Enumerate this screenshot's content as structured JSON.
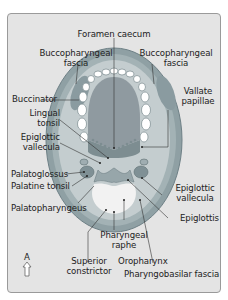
{
  "diagram": {
    "colors": {
      "background": "#e4e4e4",
      "frame_border": "#9a9a9a",
      "tongue": "#8f9aa0",
      "tongue_base": "#7a8c90",
      "mucosa": "#a9b5b8",
      "muscle": "#8a9ba0",
      "teeth": "#ffffff",
      "oropharynx_lumen": "#f2f2f2",
      "label_text": "#222222",
      "leader_line": "#333333"
    },
    "labels": {
      "foramen_caecum": "Foramen caecum",
      "buccopharyngeal_fascia_left": "Buccopharyngeal\nfascia",
      "buccopharyngeal_fascia_left_l1": "Buccopharyngeal",
      "buccopharyngeal_fascia_left_l2": "fascia",
      "buccopharyngeal_fascia_right_l1": "Buccopharyngeal",
      "buccopharyngeal_fascia_right_l2": "fascia",
      "buccinator": "Buccinator",
      "vallate_papillae_l1": "Vallate",
      "vallate_papillae_l2": "papillae",
      "lingual_tonsil_l1": "Lingual",
      "lingual_tonsil_l2": "tonsil",
      "epiglottic_vallecula_left_l1": "Epiglottic",
      "epiglottic_vallecula_left_l2": "vallecula",
      "palatoglossus": "Palatoglossus",
      "palatine_tonsil": "Palatine tonsil",
      "epiglottic_vallecula_right_l1": "Epiglottic",
      "epiglottic_vallecula_right_l2": "vallecula",
      "palatopharyngeus": "Palatopharyngeus",
      "epiglottis": "Epiglottis",
      "pharyngeal_raphe_l1": "Pharyngeal",
      "pharyngeal_raphe_l2": "raphe",
      "superior_constrictor_l1": "Superior",
      "superior_constrictor_l2": "constrictor",
      "oropharynx": "Oropharynx",
      "pharyngobasilar_fascia": "Pharyngobasilar fascia"
    },
    "orientation": {
      "letter": "A",
      "icon": "arrow-up-icon"
    }
  }
}
